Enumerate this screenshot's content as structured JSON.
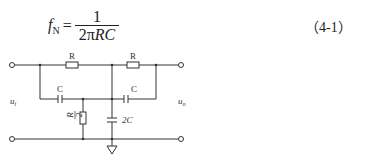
{
  "formula": {
    "lhs_symbol": "f",
    "lhs_subscript": "N",
    "equals": "=",
    "numerator": "1",
    "denominator_prefix": "2π",
    "denominator_vars": "RC",
    "equation_number": "（4-1）"
  },
  "circuit": {
    "type": "twin-T notch filter",
    "resistor_top_left_label": "R",
    "resistor_top_right_label": "R",
    "capacitor_left_label": "C",
    "capacitor_right_label": "C",
    "shunt_resistor_label_num": "R",
    "shunt_resistor_label_den": "2",
    "shunt_capacitor_label": "2C",
    "input_label": "u",
    "input_sub": "i",
    "output_label": "u",
    "output_sub": "o",
    "line_color": "#333333"
  }
}
